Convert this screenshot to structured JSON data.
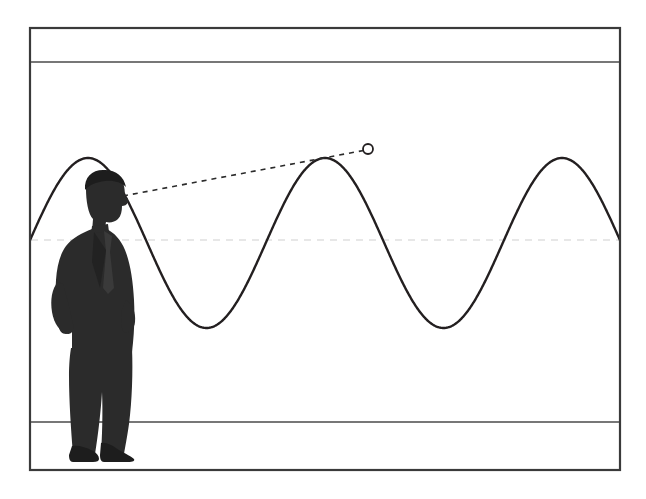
{
  "figure": {
    "background_color": "#ffffff",
    "ink_color": "#231f20",
    "frame": {
      "name": "outer-frame",
      "x": 30,
      "y": 28,
      "width": 590,
      "height": 442,
      "stroke_color": "#3a3a3a",
      "stroke_width": 2.2
    },
    "guide_lines": [
      {
        "name": "upper-baseline",
        "orientation": "horizontal",
        "y": 62,
        "x1": 30,
        "x2": 620,
        "stroke_color": "#4a4a4a",
        "stroke_width": 1.3,
        "dashed": false
      },
      {
        "name": "lower-baseline",
        "orientation": "horizontal",
        "y": 422,
        "x1": 30,
        "x2": 620,
        "stroke_color": "#4a4a4a",
        "stroke_width": 1.3,
        "dashed": false
      },
      {
        "name": "center-axis",
        "orientation": "horizontal",
        "y": 240,
        "x1": 30,
        "x2": 620,
        "stroke_color": "#cfcfcf",
        "stroke_width": 1.0,
        "dashed": true
      }
    ],
    "person": {
      "name": "man-in-suit",
      "pose": "standing, profile facing right, hands behind back",
      "fill_color": "#2b2b2b",
      "bounds": {
        "x": 52,
        "y": 172,
        "width": 88,
        "height": 284
      },
      "eye": {
        "x": 125,
        "y": 196
      }
    },
    "sight_line": {
      "name": "dashed-sight-line",
      "from": {
        "x": 123,
        "y": 196
      },
      "to": {
        "x": 366,
        "y": 150
      },
      "stroke_color": "#2b2b2b",
      "stroke_width": 1.6,
      "dash_pattern": "5 5"
    },
    "marker": {
      "name": "observation-point",
      "shape": "circle",
      "cx": 368,
      "cy": 149,
      "r": 5,
      "fill": "#ffffff",
      "stroke_color": "#231f20",
      "stroke_width": 1.8
    }
  },
  "chart_data": {
    "type": "line",
    "title": "",
    "subtitle": "",
    "xlabel": "",
    "ylabel": "",
    "grid": false,
    "legend": null,
    "series": [
      {
        "name": "sine-wave",
        "function": "y = amplitude * sin(2*pi*(x - phase)/period) + center",
        "amplitude_px": 170,
        "period_px": 237,
        "first_peak_x": 88,
        "peak_y": 73,
        "trough_y": 413,
        "center_y": 243,
        "stroke_color": "#231f20",
        "stroke_width": 2.4,
        "peaks": [
          {
            "x": 88,
            "y": 73
          },
          {
            "x": 325,
            "y": 73
          },
          {
            "x": 562,
            "y": 73
          }
        ],
        "troughs": [
          {
            "x": 207,
            "y": 413
          },
          {
            "x": 444,
            "y": 413
          }
        ],
        "x_range_px": [
          30,
          620
        ],
        "y_range_px": [
          73,
          413
        ]
      }
    ],
    "annotations": [
      {
        "name": "observation-point",
        "x": 368,
        "y": 149,
        "label": ""
      }
    ]
  }
}
